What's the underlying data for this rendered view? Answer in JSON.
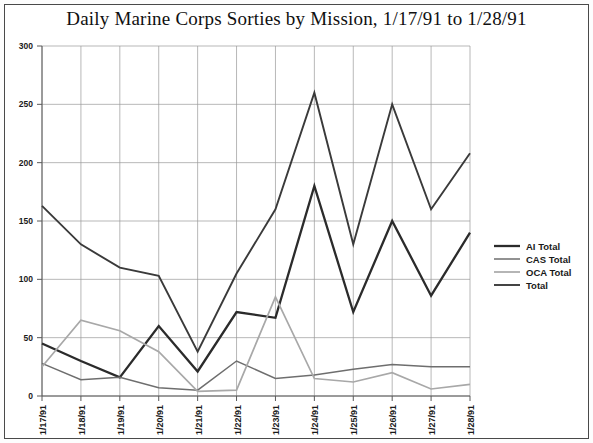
{
  "chart_data": {
    "type": "line",
    "title": "Daily Marine Corps Sorties by Mission, 1/17/91 to 1/28/91",
    "xlabel": "",
    "ylabel": "",
    "ylim": [
      0,
      300
    ],
    "yticks": [
      0,
      50,
      100,
      150,
      200,
      250,
      300
    ],
    "grid": true,
    "legend_position": "right",
    "categories": [
      "1/17/91",
      "1/18/91",
      "1/19/91",
      "1/20/91",
      "1/21/91",
      "1/22/91",
      "1/23/91",
      "1/24/91",
      "1/25/91",
      "1/26/91",
      "1/27/91",
      "1/28/91"
    ],
    "series": [
      {
        "name": "AI Total",
        "color": "#2b2b2b",
        "width": 2.3,
        "values": [
          45,
          30,
          16,
          60,
          21,
          72,
          67,
          180,
          72,
          150,
          86,
          140
        ]
      },
      {
        "name": "CAS Total",
        "color": "#6e6e6e",
        "width": 1.5,
        "values": [
          28,
          14,
          16,
          7,
          5,
          30,
          15,
          18,
          23,
          27,
          25,
          25
        ]
      },
      {
        "name": "OCA Total",
        "color": "#a8a8a8",
        "width": 1.7,
        "values": [
          25,
          65,
          56,
          38,
          4,
          5,
          85,
          15,
          12,
          20,
          6,
          10
        ]
      },
      {
        "name": "Total",
        "color": "#3a3a3a",
        "width": 1.9,
        "values": [
          163,
          130,
          110,
          103,
          38,
          105,
          160,
          260,
          130,
          250,
          160,
          208
        ]
      }
    ]
  },
  "legend": {
    "items": [
      {
        "label": "AI Total"
      },
      {
        "label": "CAS Total"
      },
      {
        "label": "OCA Total"
      },
      {
        "label": "Total"
      }
    ]
  }
}
